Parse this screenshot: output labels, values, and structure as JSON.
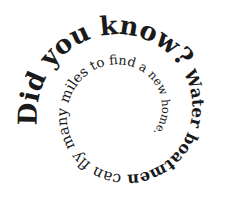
{
  "graphic": {
    "title": "Did you know?",
    "body": "Water boatmen can fly many miles to find a new home.",
    "full_text": "Did you know? Water boatmen can fly many miles to find a new home.",
    "text_color": "#1a1a1a",
    "background": "#ffffff",
    "layout": "spiral"
  }
}
